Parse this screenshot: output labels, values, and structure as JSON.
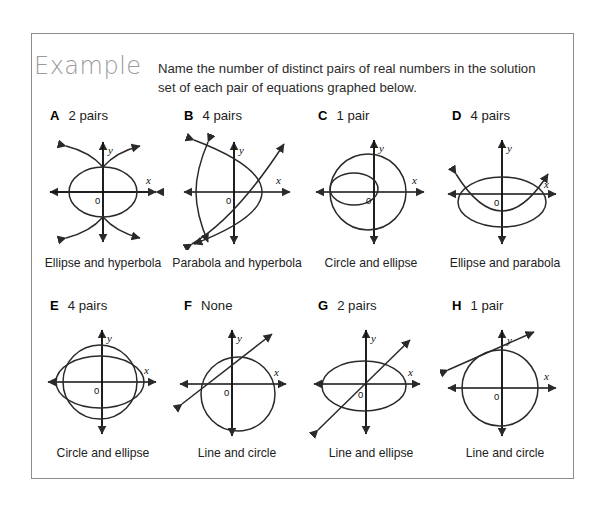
{
  "page": {
    "heading": "Example",
    "instruction": "Name the number of distinct pairs of real numbers in the solution set of each pair of equations graphed below."
  },
  "axis_labels": {
    "x": "x",
    "y": "y",
    "origin": "0"
  },
  "problems": [
    {
      "letter": "A",
      "answer": "2 pairs",
      "caption": "Ellipse and hyperbola",
      "figure": "ellipse-and-vertical-hyperbola",
      "intersections": 2
    },
    {
      "letter": "B",
      "answer": "4 pairs",
      "caption": "Parabola and hyperbola",
      "figure": "leftward-parabola-and-horizontal-hyperbola",
      "intersections": 4
    },
    {
      "letter": "C",
      "answer": "1 pair",
      "caption": "Circle and ellipse",
      "figure": "circle-and-internally-tangent-ellipse",
      "intersections": 1
    },
    {
      "letter": "D",
      "answer": "4 pairs",
      "caption": "Ellipse and parabola",
      "figure": "wide-ellipse-and-upward-parabola",
      "intersections": 4
    },
    {
      "letter": "E",
      "answer": "4 pairs",
      "caption": "Circle and ellipse",
      "figure": "circle-and-wide-ellipse-concentric",
      "intersections": 4
    },
    {
      "letter": "F",
      "answer": "None",
      "caption": "Line and circle",
      "figure": "circle-and-non-intersecting-line",
      "intersections": 0
    },
    {
      "letter": "G",
      "answer": "2 pairs",
      "caption": "Line and ellipse",
      "figure": "ellipse-and-secant-line",
      "intersections": 2
    },
    {
      "letter": "H",
      "answer": "1 pair",
      "caption": "Line and circle",
      "figure": "circle-and-tangent-line",
      "intersections": 1
    }
  ]
}
